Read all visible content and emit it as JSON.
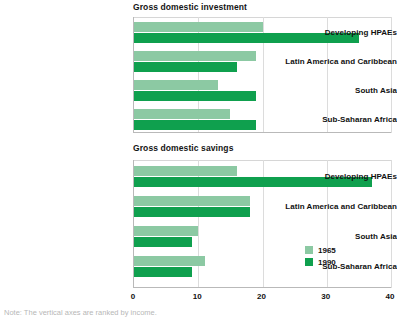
{
  "figure": {
    "background": "#ffffff",
    "footnote": "Note: The vertical axes are ranked by income."
  },
  "colors": {
    "series_1965": "#8cc9a3",
    "series_1990": "#0fa04e",
    "gridline": "#dcdcdc",
    "axis": "#b9b9b9",
    "text": "#111111"
  },
  "legend": {
    "position": "bottom-right",
    "entries": [
      {
        "label": "1965",
        "color": "#8cc9a3"
      },
      {
        "label": "1990",
        "color": "#0fa04e"
      }
    ]
  },
  "axis": {
    "ticks": [
      0,
      10,
      20,
      30,
      40
    ],
    "tick_labels": [
      "0",
      "10",
      "20",
      "30",
      "40"
    ],
    "min": 0,
    "max": 40
  },
  "chart_data": [
    {
      "type": "bar",
      "orientation": "horizontal",
      "title": "Gross domestic investment",
      "xlabel": "",
      "ylabel": "",
      "xlim": [
        0,
        40
      ],
      "grid": true,
      "legend_position": "bottom-right",
      "categories": [
        "Developing HPAEs",
        "Latin America and Caribbean",
        "South Asia",
        "Sub-Saharan Africa"
      ],
      "series": [
        {
          "name": "1965",
          "color": "#8cc9a3",
          "values": [
            20,
            19,
            13,
            15
          ]
        },
        {
          "name": "1990",
          "color": "#0fa04e",
          "values": [
            35,
            16,
            19,
            19
          ]
        }
      ]
    },
    {
      "type": "bar",
      "orientation": "horizontal",
      "title": "Gross domestic savings",
      "xlabel": "",
      "ylabel": "",
      "xlim": [
        0,
        40
      ],
      "grid": true,
      "legend_position": "bottom-right",
      "categories": [
        "Developing HPAEs",
        "Latin America and Caribbean",
        "South Asia",
        "Sub-Saharan Africa"
      ],
      "series": [
        {
          "name": "1965",
          "color": "#8cc9a3",
          "values": [
            16,
            18,
            10,
            11
          ]
        },
        {
          "name": "1990",
          "color": "#0fa04e",
          "values": [
            37,
            18,
            9,
            9
          ]
        }
      ]
    }
  ]
}
